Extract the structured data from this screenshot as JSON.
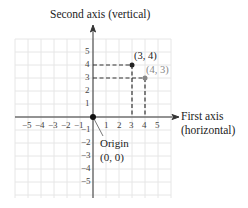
{
  "diagram": {
    "vertical_axis_label": "Second axis (vertical)",
    "horizontal_axis_label_line1": "First axis",
    "horizontal_axis_label_line2": "(horizontal)",
    "origin_label_line1": "Origin",
    "origin_label_line2": "(0, 0)",
    "x_ticks": [
      "−5",
      "−4",
      "−3",
      "−2",
      "−1",
      "1",
      "2",
      "3",
      "4",
      "5"
    ],
    "y_ticks": [
      "5",
      "4",
      "3",
      "2",
      "1",
      "−1",
      "−2",
      "−3",
      "−4",
      "−5"
    ],
    "points": [
      {
        "label": "(3, 4)",
        "x": 3,
        "y": 4,
        "color": "#222222"
      },
      {
        "label": "(4, 3)",
        "x": 4,
        "y": 3,
        "color": "#888888"
      }
    ],
    "grid_range": [
      -6,
      6
    ],
    "colors": {
      "grid": "#e6e6e6",
      "axis": "#333333",
      "dashed": "#333333"
    }
  }
}
